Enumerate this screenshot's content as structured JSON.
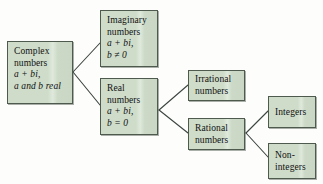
{
  "diagram": {
    "colors": {
      "node_fill": "#cedcc9",
      "node_border": "#4d5a4d",
      "edge": "#3b4440",
      "background": "#fdfdfc",
      "text": "#111111"
    },
    "nodes": {
      "complex": {
        "lines": [
          "Complex",
          "numbers"
        ],
        "line1": "Complex",
        "line2": "numbers",
        "math1": "a + bi,",
        "math2": "a and b real"
      },
      "imaginary": {
        "line1": "Imaginary",
        "line2": "numbers",
        "math1": "a + bi,",
        "math2": "b ≠ 0"
      },
      "real": {
        "line1": "Real",
        "line2": "numbers",
        "math1": "a + bi,",
        "math2": "b = 0"
      },
      "irrational": {
        "line1": "Irrational",
        "line2": "numbers"
      },
      "rational": {
        "line1": "Rational",
        "line2": "numbers"
      },
      "integers": {
        "line1": "Integers"
      },
      "nonintegers": {
        "line1": "Non-",
        "line2": "integers"
      }
    },
    "edges": [
      {
        "from": "complex",
        "to": "imaginary"
      },
      {
        "from": "complex",
        "to": "real"
      },
      {
        "from": "real",
        "to": "irrational"
      },
      {
        "from": "real",
        "to": "rational"
      },
      {
        "from": "rational",
        "to": "integers"
      },
      {
        "from": "rational",
        "to": "nonintegers"
      }
    ]
  }
}
